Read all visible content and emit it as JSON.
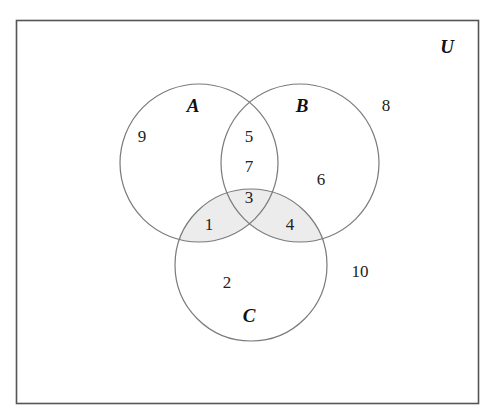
{
  "diagram": {
    "type": "venn",
    "universe_label": "U",
    "colors": {
      "frame": "#555555",
      "circle": "#7a7a7a",
      "shade": "#ececec",
      "text": "#222222"
    },
    "sets": [
      {
        "label": "A",
        "cx": 199,
        "cy": 163,
        "r": 79,
        "label_x": 193,
        "label_y": 112
      },
      {
        "label": "B",
        "cx": 300,
        "cy": 163,
        "r": 79,
        "label_x": 302,
        "label_y": 112
      },
      {
        "label": "C",
        "cx": 251,
        "cy": 265,
        "r": 76,
        "label_x": 249,
        "label_y": 322
      }
    ],
    "shaded_regions": [
      "A∩C",
      "B∩C"
    ],
    "regions": [
      {
        "name": "A only",
        "value": "9",
        "x": 142,
        "y": 142
      },
      {
        "name": "A∩B only",
        "value": "5",
        "x": 249,
        "y": 142
      },
      {
        "name": "A∩B only",
        "value": "7",
        "x": 249,
        "y": 172
      },
      {
        "name": "B only",
        "value": "6",
        "x": 321,
        "y": 185
      },
      {
        "name": "A∩B∩C",
        "value": "3",
        "x": 249,
        "y": 203
      },
      {
        "name": "A∩C only",
        "value": "1",
        "x": 209,
        "y": 230
      },
      {
        "name": "B∩C only",
        "value": "4",
        "x": 290,
        "y": 230
      },
      {
        "name": "C only",
        "value": "2",
        "x": 227,
        "y": 288
      },
      {
        "name": "outside (upper right)",
        "value": "8",
        "x": 386,
        "y": 111
      },
      {
        "name": "outside (lower right)",
        "value": "10",
        "x": 360,
        "y": 277
      }
    ]
  }
}
